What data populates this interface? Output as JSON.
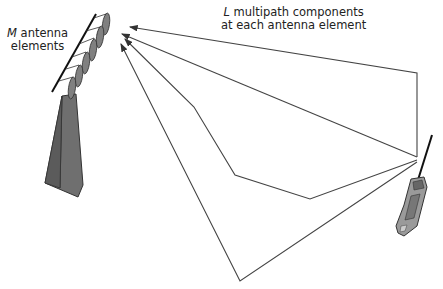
{
  "diagram": {
    "antenna_label": {
      "symbol": "M",
      "line1": "antenna",
      "line2": "elements"
    },
    "multipath_label": {
      "symbol": "L",
      "line1": "multipath components",
      "line2": "at each antenna element"
    },
    "elements": {
      "antenna_array": "M antenna elements on tower",
      "tower": "base station tower",
      "handset": "mobile phone",
      "paths": [
        {
          "id": "path-1",
          "points": [
            [
              417,
              157
            ],
            [
              417,
              73
            ],
            [
              130,
              27
            ]
          ]
        },
        {
          "id": "path-2",
          "points": [
            [
              417,
              157
            ],
            [
              122,
              34
            ]
          ]
        },
        {
          "id": "path-3",
          "points": [
            [
              417,
              160
            ],
            [
              310,
              199
            ],
            [
              235,
              175
            ],
            [
              194,
              107
            ],
            [
              125,
              39
            ]
          ]
        },
        {
          "id": "path-4",
          "points": [
            [
              417,
              162
            ],
            [
              240,
              281
            ],
            [
              121,
              44
            ]
          ]
        }
      ]
    },
    "colors": {
      "line": "#444444",
      "tower": "#6f6f6f",
      "element": "#808080"
    }
  }
}
